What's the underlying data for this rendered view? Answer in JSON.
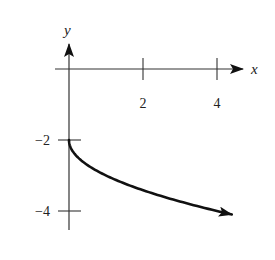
{
  "chart_data": {
    "type": "line",
    "title": "",
    "xlabel": "x",
    "ylabel": "y",
    "xlim": [
      -0.2,
      4.9
    ],
    "ylim": [
      -4.6,
      0.6
    ],
    "grid": false,
    "legend": null,
    "x_ticks": [
      2,
      4
    ],
    "x_tick_labels": [
      "2",
      "4"
    ],
    "y_ticks": [
      -2,
      -4
    ],
    "y_tick_labels": [
      "−2",
      "−4"
    ],
    "series": [
      {
        "name": "y = -sqrt(x) - 2",
        "color": "#111111",
        "end_arrow": true,
        "x": [
          0,
          0.05,
          0.25,
          0.5,
          1,
          1.5,
          2,
          2.5,
          3,
          3.5,
          4,
          4.4
        ],
        "y": [
          -2,
          -2.22,
          -2.5,
          -2.71,
          -3,
          -3.22,
          -3.41,
          -3.58,
          -3.73,
          -3.87,
          -4,
          -4.1
        ]
      }
    ]
  }
}
